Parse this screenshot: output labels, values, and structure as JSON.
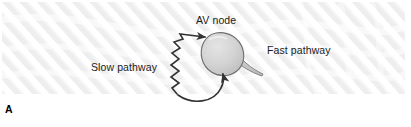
{
  "figure": {
    "panel_letter": "A",
    "labels": {
      "av_node": "AV node",
      "slow_pathway": "Slow pathway",
      "fast_pathway": "Fast pathway"
    },
    "colors": {
      "background": "#ffffff",
      "texture_stripe": "#e9e9e9",
      "node_fill": "#d4d4d4",
      "node_outline": "#6e6e6e",
      "arrow": "#333333",
      "text": "#1b1b1b"
    },
    "elements": {
      "av_node_shape": "teardrop",
      "slow_pathway_arrow": "zigzag-arrow",
      "fast_pathway_arrow": "curved-arrow",
      "background_pattern": "diagonal-wave-stripes"
    }
  }
}
